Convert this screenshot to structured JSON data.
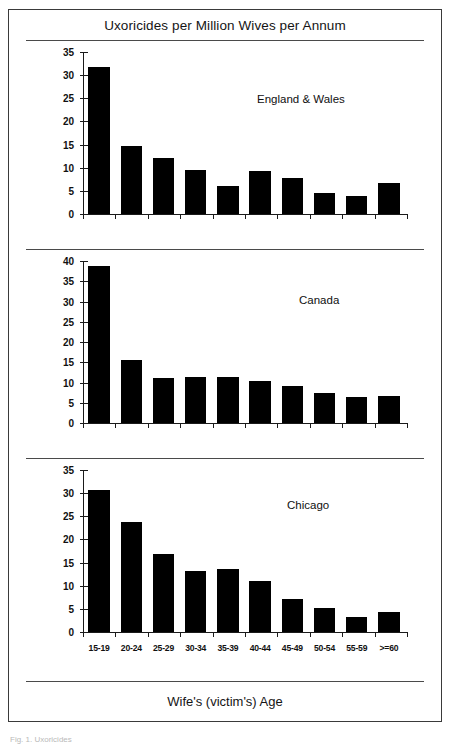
{
  "figure": {
    "title": "Uxoricides per Million Wives per Annum",
    "x_axis_title": "Wife's (victim's) Age",
    "caption": "Fig. 1. Uxoricides",
    "bar_color": "#000000",
    "axis_color": "#1a1a1a",
    "frame_color": "#3a3a3a"
  },
  "chart_data": [
    {
      "type": "bar",
      "title": "England & Wales",
      "xlabel": "Wife's (victim's) Age",
      "ylabel": "Uxoricides per Million Wives per Annum",
      "categories": [
        "15-19",
        "20-24",
        "25-29",
        "30-34",
        "35-39",
        "40-44",
        "45-49",
        "50-54",
        "55-59",
        ">=60"
      ],
      "values": [
        32.0,
        15.0,
        12.3,
        9.7,
        6.2,
        9.5,
        8.0,
        4.8,
        4.2,
        7.0
      ],
      "ylim": [
        0,
        35
      ],
      "yticks": [
        0,
        5,
        10,
        15,
        20,
        25,
        30,
        35
      ],
      "grid": false,
      "legend": false
    },
    {
      "type": "bar",
      "title": "Canada",
      "xlabel": "Wife's (victim's) Age",
      "ylabel": "Uxoricides per Million Wives per Annum",
      "categories": [
        "15-19",
        "20-24",
        "25-29",
        "30-34",
        "35-39",
        "40-44",
        "45-49",
        "50-54",
        "55-59",
        ">=60"
      ],
      "values": [
        38.9,
        15.7,
        11.3,
        11.5,
        11.7,
        10.6,
        9.4,
        7.6,
        6.7,
        7.0
      ],
      "ylim": [
        0,
        40
      ],
      "yticks": [
        0,
        5,
        10,
        15,
        20,
        25,
        30,
        35,
        40
      ],
      "grid": false,
      "legend": false
    },
    {
      "type": "bar",
      "title": "Chicago",
      "xlabel": "Wife's (victim's) Age",
      "ylabel": "Uxoricides per Million Wives per Annum",
      "categories": [
        "15-19",
        "20-24",
        "25-29",
        "30-34",
        "35-39",
        "40-44",
        "45-49",
        "50-54",
        "55-59",
        ">=60"
      ],
      "values": [
        31.0,
        24.0,
        17.0,
        13.5,
        13.8,
        11.2,
        7.4,
        5.5,
        3.5,
        4.5
      ],
      "ylim": [
        0,
        35
      ],
      "yticks": [
        0,
        5,
        10,
        15,
        20,
        25,
        30,
        35
      ],
      "grid": false,
      "legend": false
    }
  ]
}
